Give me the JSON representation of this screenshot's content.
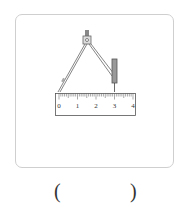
{
  "figure": {
    "ruler": {
      "tick_labels": [
        "0",
        "1",
        "2",
        "3",
        "4"
      ],
      "unit": "cm"
    },
    "compass": {
      "needle_at": "0",
      "pencil_at": "3"
    }
  },
  "answer": {
    "left_paren": "(",
    "right_paren": ")"
  }
}
